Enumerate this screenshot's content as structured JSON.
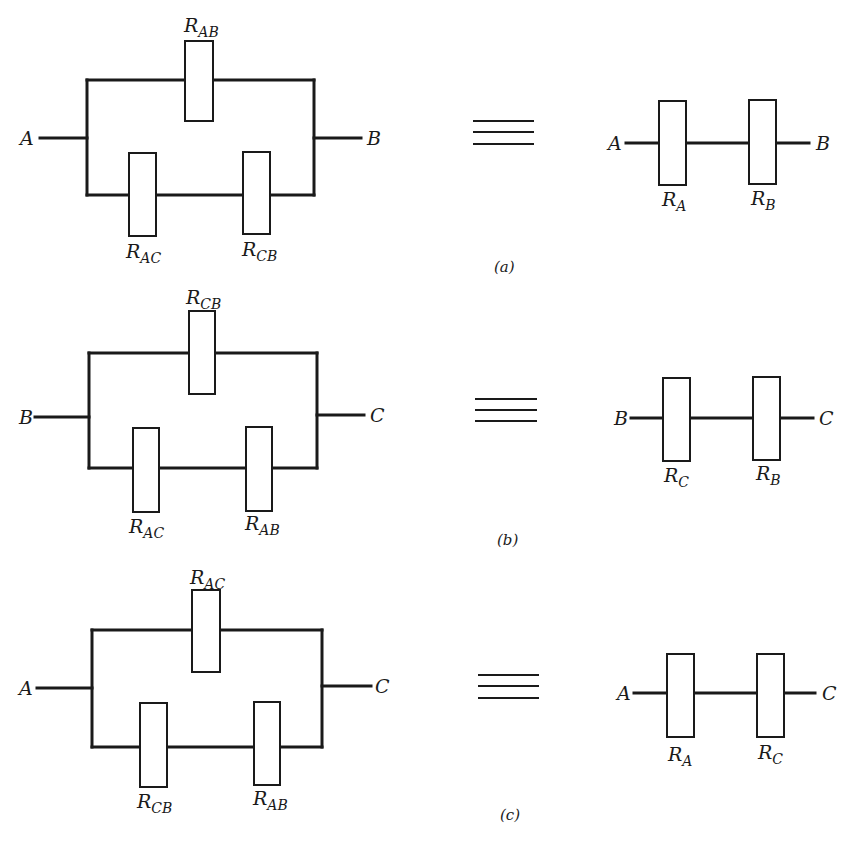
{
  "figure": {
    "panels": [
      {
        "id": "a",
        "caption": "(a)",
        "caption_pos": [
          494,
          272
        ],
        "delta": {
          "left_x": 87,
          "right_x": 314,
          "top_y": 80,
          "bottom_y": 195,
          "in_terminal": {
            "label": "A",
            "y": 138,
            "x_start": 40,
            "label_x": 20
          },
          "out_terminal": {
            "label": "B",
            "y": 138,
            "x_end": 361,
            "label_x": 367
          },
          "resistors": [
            {
              "name": "R",
              "sub": "AB",
              "x": 185,
              "y": 41,
              "w": 28,
              "h": 80,
              "label_x": 184,
              "label_y": 32,
              "position": "top"
            },
            {
              "name": "R",
              "sub": "AC",
              "x": 129,
              "y": 153,
              "w": 27,
              "h": 83,
              "label_x": 126,
              "label_y": 258,
              "position": "bottom-left"
            },
            {
              "name": "R",
              "sub": "CB",
              "x": 243,
              "y": 152,
              "w": 27,
              "h": 82,
              "label_x": 242,
              "label_y": 256,
              "position": "bottom-right"
            }
          ]
        },
        "equivalence": {
          "x1": 473,
          "x2": 534,
          "ys": [
            121,
            132,
            144
          ]
        },
        "series": {
          "wire_y": 143,
          "x_start": 626,
          "x_end": 809,
          "in_terminal": {
            "label": "A",
            "label_x": 608
          },
          "out_terminal": {
            "label": "B",
            "label_x": 816
          },
          "resistors": [
            {
              "name": "R",
              "sub": "A",
              "x": 659,
              "y": 101,
              "w": 27,
              "h": 84,
              "label_x": 662,
              "label_y": 206
            },
            {
              "name": "R",
              "sub": "B",
              "x": 749,
              "y": 100,
              "w": 27,
              "h": 84,
              "label_x": 751,
              "label_y": 205
            }
          ]
        }
      },
      {
        "id": "b",
        "caption": "(b)",
        "caption_pos": [
          497,
          545
        ],
        "delta": {
          "left_x": 89,
          "right_x": 317,
          "top_y": 353,
          "bottom_y": 468,
          "in_terminal": {
            "label": "B",
            "y": 417,
            "x_start": 35,
            "label_x": 19
          },
          "out_terminal": {
            "label": "C",
            "y": 415,
            "x_end": 364,
            "label_x": 370
          },
          "resistors": [
            {
              "name": "R",
              "sub": "CB",
              "x": 189,
              "y": 311,
              "w": 26,
              "h": 83,
              "label_x": 186,
              "label_y": 304,
              "position": "top"
            },
            {
              "name": "R",
              "sub": "AC",
              "x": 133,
              "y": 428,
              "w": 26,
              "h": 84,
              "label_x": 129,
              "label_y": 533,
              "position": "bottom-left"
            },
            {
              "name": "R",
              "sub": "AB",
              "x": 246,
              "y": 427,
              "w": 26,
              "h": 84,
              "label_x": 245,
              "label_y": 530,
              "position": "bottom-right"
            }
          ]
        },
        "equivalence": {
          "x1": 475,
          "x2": 537,
          "ys": [
            399,
            410,
            421
          ]
        },
        "series": {
          "wire_y": 418,
          "x_start": 631,
          "x_end": 813,
          "in_terminal": {
            "label": "B",
            "label_x": 614
          },
          "out_terminal": {
            "label": "C",
            "label_x": 819
          },
          "resistors": [
            {
              "name": "R",
              "sub": "C",
              "x": 663,
              "y": 378,
              "w": 27,
              "h": 83,
              "label_x": 664,
              "label_y": 482
            },
            {
              "name": "R",
              "sub": "B",
              "x": 753,
              "y": 377,
              "w": 27,
              "h": 83,
              "label_x": 756,
              "label_y": 480
            }
          ]
        }
      },
      {
        "id": "c",
        "caption": "(c)",
        "caption_pos": [
          500,
          820
        ],
        "delta": {
          "left_x": 92,
          "right_x": 322,
          "top_y": 630,
          "bottom_y": 747,
          "in_terminal": {
            "label": "A",
            "y": 688,
            "x_start": 37,
            "label_x": 19
          },
          "out_terminal": {
            "label": "C",
            "y": 686,
            "x_end": 371,
            "label_x": 375
          },
          "resistors": [
            {
              "name": "R",
              "sub": "AC",
              "x": 192,
              "y": 590,
              "w": 28,
              "h": 82,
              "label_x": 190,
              "label_y": 584,
              "position": "top"
            },
            {
              "name": "R",
              "sub": "CB",
              "x": 140,
              "y": 703,
              "w": 27,
              "h": 84,
              "label_x": 137,
              "label_y": 808,
              "position": "bottom-left"
            },
            {
              "name": "R",
              "sub": "AB",
              "x": 254,
              "y": 702,
              "w": 26,
              "h": 83,
              "label_x": 253,
              "label_y": 805,
              "position": "bottom-right"
            }
          ]
        },
        "equivalence": {
          "x1": 478,
          "x2": 539,
          "ys": [
            675,
            686,
            698
          ]
        },
        "series": {
          "wire_y": 693,
          "x_start": 634,
          "x_end": 815,
          "in_terminal": {
            "label": "A",
            "label_x": 617
          },
          "out_terminal": {
            "label": "C",
            "label_x": 822
          },
          "resistors": [
            {
              "name": "R",
              "sub": "A",
              "x": 667,
              "y": 654,
              "w": 27,
              "h": 83,
              "label_x": 668,
              "label_y": 761
            },
            {
              "name": "R",
              "sub": "C",
              "x": 757,
              "y": 654,
              "w": 27,
              "h": 83,
              "label_x": 758,
              "label_y": 759
            }
          ]
        }
      }
    ]
  }
}
